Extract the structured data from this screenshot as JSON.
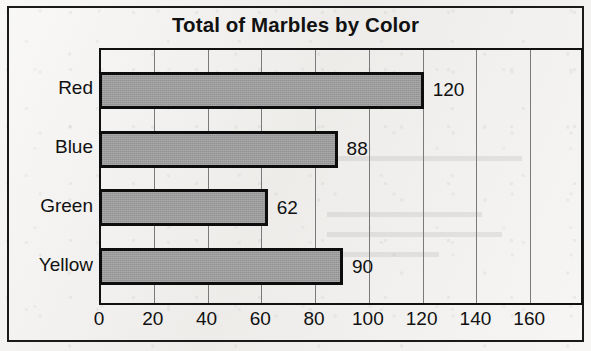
{
  "chart_data": {
    "type": "bar",
    "orientation": "horizontal",
    "title": "Total of Marbles by Color",
    "xlabel": "",
    "ylabel": "",
    "categories": [
      "Red",
      "Blue",
      "Green",
      "Yellow"
    ],
    "values": [
      120,
      88,
      62,
      90
    ],
    "value_labels": [
      "120",
      "88",
      "62",
      "90"
    ],
    "xlim": [
      0,
      180
    ],
    "xticks": [
      0,
      20,
      40,
      60,
      80,
      100,
      120,
      140,
      160
    ],
    "xtick_labels": [
      "0",
      "20",
      "40",
      "60",
      "80",
      "100",
      "120",
      "140",
      "160"
    ],
    "gridlines": true,
    "grid_axis": "x",
    "legend": false,
    "bar_fill_color": "#9a9a9a",
    "bar_border_color": "#0d0d0d",
    "frame_color": "#1a1a1a",
    "background_color": "#f1f0ee"
  }
}
